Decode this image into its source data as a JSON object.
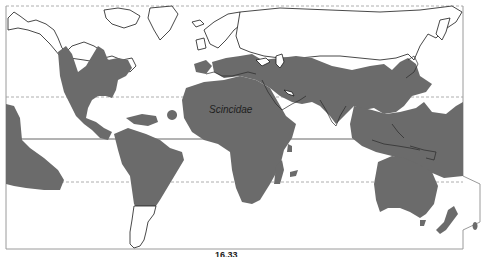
{
  "map": {
    "title": "Scincidae",
    "taxon_label": "Scincidae",
    "caption": "16.33",
    "range_color": "#6b6b6b",
    "reference_lines": [
      "Tropic of Cancer",
      "Equator",
      "Tropic of Capricorn"
    ],
    "regions_shaded": [
      "North America (southern US, Mexico)",
      "Central America and Caribbean",
      "South America (north and central)",
      "Southern Europe / Mediterranean",
      "Africa",
      "Madagascar",
      "Arabia and Middle East",
      "Central and South Asia",
      "East Asia and Japan",
      "Southeast Asia and Indonesia",
      "New Guinea and Pacific islands",
      "Australia",
      "New Zealand",
      "Eastern Pacific islands",
      "Atlantic islands"
    ]
  }
}
